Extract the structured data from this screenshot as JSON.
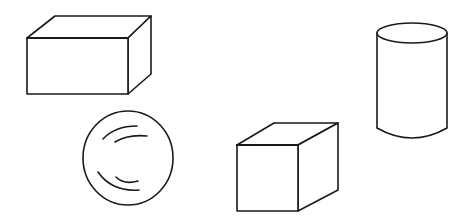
{
  "figure": {
    "colors": {
      "background": "#ffffff",
      "line": "#1a1a1a"
    },
    "shapes": [
      {
        "id": "rectangular-prism",
        "label": "rectangular prism"
      },
      {
        "id": "sphere",
        "label": "sphere"
      },
      {
        "id": "cube",
        "label": "cube"
      },
      {
        "id": "cylinder",
        "label": "cylinder"
      }
    ]
  }
}
